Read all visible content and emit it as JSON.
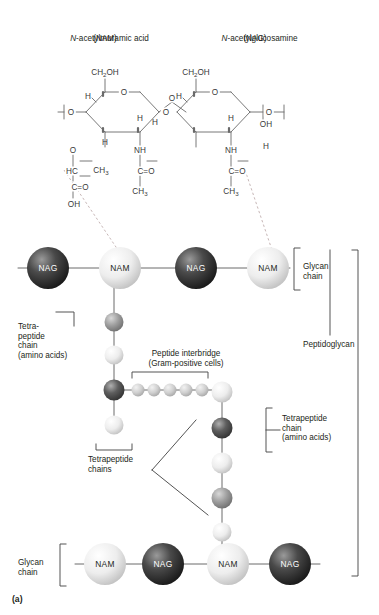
{
  "figure": {
    "panel_label": "(a)",
    "title_nam": "N-acetylmuramic acid",
    "title_nam_abbr": "(NAM)",
    "title_nag": "N-acetylglucosamine",
    "title_nag_abbr": "(NAG)"
  },
  "chemistry": {
    "nam": {
      "ch2oh": "CH2OH",
      "ring_o": "O",
      "h_top_left": "H",
      "o_left": "O",
      "h_bottom_left": "H",
      "h_center": "H",
      "nh": "NH",
      "c_o": "C=O",
      "ch3_acetyl": "CH3",
      "o_lactyl": "O",
      "hc": "HC",
      "ch3_lactyl": "CH3",
      "c_o_acid": "C=O",
      "oh": "OH"
    },
    "nag": {
      "ch2oh": "CH2OH",
      "ring_o": "O",
      "h_top": "H",
      "oh": "OH",
      "h_lower": "H",
      "h_center": "H",
      "nh": "NH",
      "c_o": "C=O",
      "ch3": "CH3",
      "o_right": "O"
    }
  },
  "labels": {
    "glycan_chain_top": "Glycan\nchain",
    "glycan_chain_bottom": "Glycan\nchain",
    "tetrapeptide_left": "Tetra-\npeptide\nchain\n(amino acids)",
    "tetrapeptide_right": "Tetrapeptide\nchain\n(amino acids)",
    "tetrapeptide_chains": "Tetrapeptide\nchains",
    "peptide_interbridge": "Peptide interbridge\n(Gram-positive cells)",
    "peptidoglycan": "Peptidoglycan"
  },
  "colors": {
    "nag_sphere": "#3b3b3b",
    "nam_sphere": "#ebebeb",
    "amino_dark": "#5a5a5a",
    "amino_mid": "#9a9a9a",
    "amino_light": "#e8e8e8",
    "interbridge": "#c9c9c9",
    "line": "#5a5a5a",
    "dashed": "#b9a8a8",
    "text": "#231f20"
  },
  "glycan_top": {
    "y": 268,
    "spheres": [
      {
        "label": "NAG",
        "x": 48,
        "type": "nag"
      },
      {
        "label": "NAM",
        "x": 120,
        "type": "nam"
      },
      {
        "label": "NAG",
        "x": 196,
        "type": "nag"
      },
      {
        "label": "NAM",
        "x": 268,
        "type": "nam"
      }
    ]
  },
  "glycan_bottom": {
    "y": 564,
    "spheres": [
      {
        "label": "NAM",
        "x": 105,
        "type": "nam"
      },
      {
        "label": "NAG",
        "x": 163,
        "type": "nag"
      },
      {
        "label": "NAM",
        "x": 228,
        "type": "nam"
      },
      {
        "label": "NAG",
        "x": 290,
        "type": "nag"
      }
    ]
  },
  "tetrapeptide_left_chain": {
    "x": 114,
    "beads": [
      {
        "y": 322,
        "shade": "amino_mid",
        "r": 9
      },
      {
        "y": 355,
        "shade": "amino_light",
        "r": 9
      },
      {
        "y": 390,
        "shade": "amino_dark",
        "r": 10
      },
      {
        "y": 425,
        "shade": "amino_light",
        "r": 9
      }
    ]
  },
  "tetrapeptide_right_chain": {
    "x": 222,
    "beads": [
      {
        "y": 392,
        "shade": "amino_light",
        "r": 10
      },
      {
        "y": 428,
        "shade": "amino_dark",
        "r": 10
      },
      {
        "y": 463,
        "shade": "amino_light",
        "r": 10
      },
      {
        "y": 498,
        "shade": "amino_mid",
        "r": 10
      },
      {
        "y": 532,
        "shade": "amino_light",
        "r": 9
      }
    ]
  },
  "interbridge_beads": {
    "y": 390,
    "r": 6.5,
    "x_positions": [
      138,
      154,
      170,
      186,
      202
    ]
  }
}
